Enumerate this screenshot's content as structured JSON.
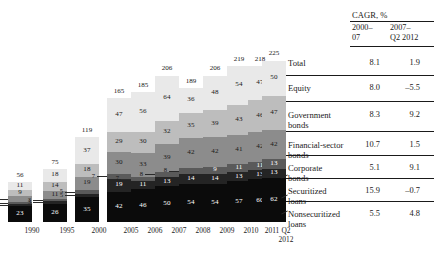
{
  "chart_data": {
    "type": "bar",
    "subtype": "stacked",
    "title": "",
    "xlabel": "",
    "ylabel": "",
    "categories": [
      "1990",
      "1995",
      "2000",
      "2005",
      "2006",
      "2007",
      "2008",
      "2009",
      "2010",
      "2011",
      "Q2 2012"
    ],
    "category_lines": [
      [
        "1990"
      ],
      [
        "1995"
      ],
      [
        "2000"
      ],
      [
        "2005"
      ],
      [
        "2006"
      ],
      [
        "2007"
      ],
      [
        "2008"
      ],
      [
        "2009"
      ],
      [
        "2010"
      ],
      [
        "2011"
      ],
      [
        "Q2",
        "2012"
      ]
    ],
    "totals": [
      56,
      75,
      119,
      165,
      185,
      206,
      189,
      206,
      219,
      218,
      225
    ],
    "ylim": [
      0,
      225
    ],
    "grid": false,
    "legend_position": "right-table",
    "series": [
      {
        "name": "Equity",
        "color": "#e9e9e9",
        "values": [
          11,
          18,
          37,
          47,
          56,
          64,
          36,
          48,
          54,
          47,
          50
        ]
      },
      {
        "name": "Government bonds",
        "color": "#bdbdbd",
        "values": [
          9,
          14,
          18,
          29,
          30,
          32,
          35,
          39,
          43,
          46,
          47
        ]
      },
      {
        "name": "Financial-sector bonds",
        "color": "#8c8c8c",
        "values": [
          8,
          11,
          19,
          30,
          33,
          39,
          42,
          42,
          41,
          42,
          42
        ]
      },
      {
        "name": "Corporate bonds",
        "color": "#5a5a5a",
        "values": [
          3,
          3,
          5,
          7,
          7,
          8,
          8,
          9,
          11,
          11,
          13
        ]
      },
      {
        "name": "Securitized loans",
        "color": "#242424",
        "values": [
          2,
          3,
          5,
          19,
          11,
          13,
          14,
          14,
          13,
          13,
          13
        ]
      },
      {
        "name": "Nonsecuritized loans",
        "color": "#0b0b0b",
        "values": [
          23,
          26,
          35,
          42,
          46,
          50,
          54,
          54,
          57,
          60,
          62
        ]
      }
    ],
    "callouts": [
      {
        "category": "1990",
        "series": "Financial-sector bonds",
        "label": "8"
      },
      {
        "category": "1990",
        "series": "Corporate bonds",
        "label": "3"
      },
      {
        "category": "1990",
        "series": "Securitized loans",
        "label": "2"
      },
      {
        "category": "1995",
        "series": "Corporate bonds",
        "label": "3"
      },
      {
        "category": "1995",
        "series": "Securitized loans",
        "label": "3"
      },
      {
        "category": "2000",
        "series": "Corporate bonds",
        "label": "5"
      },
      {
        "category": "2000",
        "series": "Securitized loans",
        "label": "5"
      },
      {
        "category": "2005",
        "series": "Corporate bonds",
        "label": "7"
      },
      {
        "category": "2006",
        "series": "Corporate bonds",
        "label": "7"
      },
      {
        "category": "2007",
        "series": "Corporate bonds",
        "label": "8"
      },
      {
        "category": "2008",
        "series": "Corporate bonds",
        "label": "8"
      }
    ]
  },
  "table": {
    "header": {
      "title": "CAGR, %",
      "col1_line1": "2000–",
      "col1_line2": "07",
      "col2_line1": "2007–",
      "col2_line2": "Q2 2012"
    },
    "rows": [
      {
        "name_line1": "Total",
        "name_line2": "",
        "c1": "8.1",
        "c2": "1.9"
      },
      {
        "name_line1": "Equity",
        "name_line2": "",
        "c1": "8.0",
        "c2": "–5.5"
      },
      {
        "name_line1": "Government",
        "name_line2": "bonds",
        "c1": "8.3",
        "c2": "9.2"
      },
      {
        "name_line1": "Financial-sector",
        "name_line2": "bonds",
        "c1": "10.7",
        "c2": "1.5"
      },
      {
        "name_line1": "Corporate",
        "name_line2": "bonds",
        "c1": "5.1",
        "c2": "9.1"
      },
      {
        "name_line1": "Securitized",
        "name_line2": "loans",
        "c1": "15.9",
        "c2": "–0.7"
      },
      {
        "name_line1": "Nonsecuritized",
        "name_line2": "loans",
        "c1": "5.5",
        "c2": "4.8"
      }
    ]
  }
}
